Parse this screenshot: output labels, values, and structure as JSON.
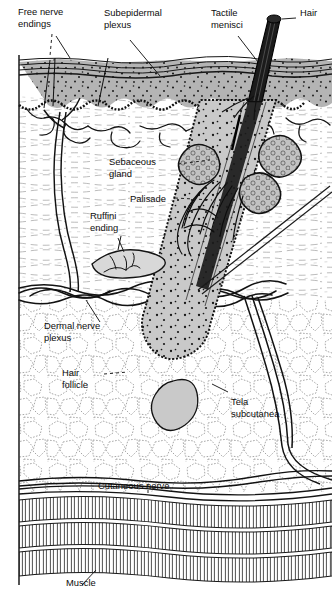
{
  "figure": {
    "background_color": "#ffffff",
    "ink_color": "#111111",
    "epidermis_fill": "#b4b4b4",
    "follicle_fill": "#c9c9c9",
    "gland_fill": "#c2c2c2",
    "width": 332,
    "height": 600
  },
  "labels": {
    "free_nerve_endings": {
      "line1": "Free nerve",
      "line2": "endings"
    },
    "subepidermal_plexus": {
      "line1": "Subepidermal",
      "line2": "plexus"
    },
    "tactile_menisci": {
      "line1": "Tactile",
      "line2": "menisci"
    },
    "hair": {
      "line1": "Hair"
    },
    "sebaceous_gland": {
      "line1": "Sebaceous",
      "line2": "gland"
    },
    "palisade": {
      "line1": "Palisade"
    },
    "ruffini_ending": {
      "line1": "Ruffini",
      "line2": "ending"
    },
    "dermal_nerve_plexus": {
      "line1": "Dermal nerve",
      "line2": "plexus"
    },
    "hair_follicle": {
      "line1": "Hair",
      "line2": "follicle"
    },
    "tela_subcutanea": {
      "line1": "Tela",
      "line2": "subcutanea"
    },
    "cutaneous_nerve": {
      "line1": "Cutaneous nerve"
    },
    "muscle": {
      "line1": "Muscle"
    }
  }
}
